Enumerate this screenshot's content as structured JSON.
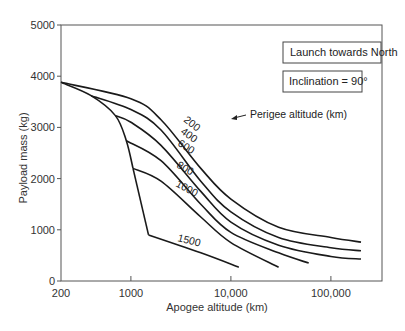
{
  "chart_data": {
    "type": "line",
    "title": "",
    "xlabel": "Apogee altitude (km)",
    "ylabel": "Payload mass (kg)",
    "xscale": "log",
    "xlim": [
      200,
      300000
    ],
    "ylim": [
      0,
      5000
    ],
    "x_ticks": [
      200,
      1000,
      10000,
      100000
    ],
    "x_tick_labels": [
      "200",
      "1000",
      "10,000",
      "100,000"
    ],
    "y_ticks": [
      0,
      1000,
      2000,
      3000,
      4000,
      5000
    ],
    "y_tick_labels": [
      "0",
      "1000",
      "2000",
      "3000",
      "4000",
      "5000"
    ],
    "grid": false,
    "annotations": [
      "Launch towards North",
      "Inclination = 90°",
      "Perigee altitude (km)"
    ],
    "series": [
      {
        "name": "200",
        "points": [
          [
            200,
            3880
          ],
          [
            1000,
            3560
          ],
          [
            2000,
            3150
          ],
          [
            5000,
            2200
          ],
          [
            10000,
            1600
          ],
          [
            30000,
            1050
          ],
          [
            100000,
            850
          ],
          [
            200000,
            760
          ]
        ]
      },
      {
        "name": "400",
        "points": [
          [
            400,
            3620
          ],
          [
            1000,
            3350
          ],
          [
            2000,
            2950
          ],
          [
            5000,
            1950
          ],
          [
            10000,
            1350
          ],
          [
            30000,
            850
          ],
          [
            100000,
            650
          ],
          [
            200000,
            590
          ]
        ]
      },
      {
        "name": "600",
        "points": [
          [
            700,
            3230
          ],
          [
            1000,
            3100
          ],
          [
            2000,
            2650
          ],
          [
            5000,
            1750
          ],
          [
            10000,
            1150
          ],
          [
            30000,
            700
          ],
          [
            100000,
            480
          ],
          [
            200000,
            430
          ]
        ]
      },
      {
        "name": "800",
        "points": [
          [
            900,
            2740
          ],
          [
            2000,
            2350
          ],
          [
            5000,
            1500
          ],
          [
            10000,
            950
          ],
          [
            30000,
            550
          ],
          [
            60000,
            350
          ]
        ]
      },
      {
        "name": "1000",
        "points": [
          [
            1050,
            2200
          ],
          [
            2000,
            1950
          ],
          [
            5000,
            1250
          ],
          [
            10000,
            750
          ],
          [
            30000,
            270
          ]
        ]
      },
      {
        "name": "1500",
        "points": [
          [
            1500,
            900
          ],
          [
            5000,
            550
          ],
          [
            12000,
            270
          ]
        ]
      }
    ],
    "envelope": {
      "name": "boundary",
      "points": [
        [
          200,
          3880
        ],
        [
          400,
          3620
        ],
        [
          700,
          3230
        ],
        [
          900,
          2740
        ],
        [
          1050,
          2200
        ],
        [
          1500,
          900
        ]
      ]
    }
  },
  "labels": {
    "box1": "Launch towards North",
    "box2": "Inclination = 90°",
    "perigee": "Perigee altitude (km)",
    "xlabel": "Apogee altitude (km)",
    "ylabel": "Payload mass (kg)"
  }
}
